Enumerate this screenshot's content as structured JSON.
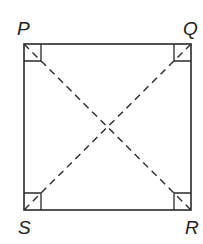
{
  "diagram": {
    "type": "geometry",
    "shape": "square",
    "vertices": [
      {
        "label": "P",
        "position": "top-left"
      },
      {
        "label": "Q",
        "position": "top-right"
      },
      {
        "label": "R",
        "position": "bottom-right"
      },
      {
        "label": "S",
        "position": "bottom-left"
      }
    ],
    "sides": [
      "PQ",
      "QR",
      "RS",
      "SP"
    ],
    "diagonals": [
      {
        "from": "P",
        "to": "R",
        "style": "dashed"
      },
      {
        "from": "Q",
        "to": "S",
        "style": "dashed"
      }
    ],
    "right_angle_markers": [
      "P",
      "Q",
      "R",
      "S"
    ],
    "labels": {
      "P": "P",
      "Q": "Q",
      "R": "R",
      "S": "S"
    },
    "colors": {
      "stroke": "#2a2a2a",
      "background": "#ffffff"
    }
  }
}
